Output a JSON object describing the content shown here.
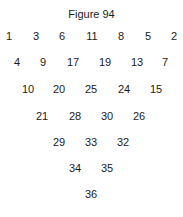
{
  "title": "Figure 94",
  "rows": [
    {
      "y": 36,
      "items": [
        {
          "v": "1",
          "x": 9
        },
        {
          "v": "3",
          "x": 36
        },
        {
          "v": "6",
          "x": 62
        },
        {
          "v": "11",
          "x": 92
        },
        {
          "v": "8",
          "x": 121
        },
        {
          "v": "5",
          "x": 148
        },
        {
          "v": "2",
          "x": 174
        }
      ]
    },
    {
      "y": 62,
      "items": [
        {
          "v": "4",
          "x": 17
        },
        {
          "v": "9",
          "x": 43
        },
        {
          "v": "17",
          "x": 73
        },
        {
          "v": "19",
          "x": 105
        },
        {
          "v": "13",
          "x": 137
        },
        {
          "v": "7",
          "x": 165
        }
      ]
    },
    {
      "y": 89,
      "items": [
        {
          "v": "10",
          "x": 28
        },
        {
          "v": "20",
          "x": 59
        },
        {
          "v": "25",
          "x": 91
        },
        {
          "v": "24",
          "x": 124
        },
        {
          "v": "15",
          "x": 156
        }
      ]
    },
    {
      "y": 116,
      "items": [
        {
          "v": "21",
          "x": 42
        },
        {
          "v": "28",
          "x": 75
        },
        {
          "v": "30",
          "x": 107
        },
        {
          "v": "26",
          "x": 139
        }
      ]
    },
    {
      "y": 142,
      "items": [
        {
          "v": "29",
          "x": 59
        },
        {
          "v": "33",
          "x": 91
        },
        {
          "v": "32",
          "x": 123
        }
      ]
    },
    {
      "y": 168,
      "items": [
        {
          "v": "34",
          "x": 75
        },
        {
          "v": "35",
          "x": 107
        }
      ]
    },
    {
      "y": 194,
      "items": [
        {
          "v": "36",
          "x": 91
        }
      ]
    }
  ]
}
